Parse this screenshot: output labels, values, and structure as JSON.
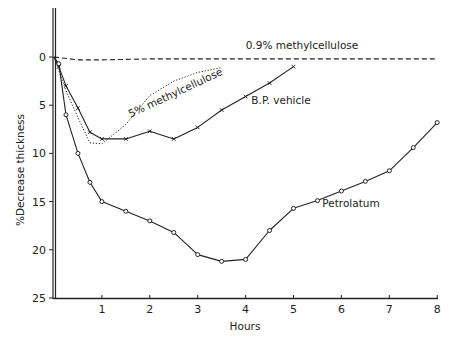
{
  "chart_data": {
    "type": "line",
    "title": "",
    "xlabel": "Hours",
    "ylabel": "%Decrease thickness",
    "xlim": [
      0,
      8
    ],
    "ylim": [
      0,
      25
    ],
    "y_inverted": true,
    "grid": false,
    "legend": "none (inline annotations)",
    "x_ticks": [
      "1",
      "2",
      "3",
      "4",
      "5",
      "6",
      "7",
      "8"
    ],
    "y_ticks": [
      "0",
      "5",
      "10",
      "15",
      "20",
      "25"
    ],
    "series": [
      {
        "name": "0.9% methylcellulose",
        "style": "dashed",
        "marker": "none",
        "x": [
          0,
          0.5,
          1,
          2,
          3,
          4,
          5,
          6,
          7,
          8
        ],
        "y": [
          0,
          0.3,
          0.3,
          0.2,
          0.2,
          0.2,
          0.2,
          0.2,
          0.2,
          0.2
        ]
      },
      {
        "name": "5% methylcellulose",
        "style": "dotted",
        "marker": "none",
        "x": [
          0,
          0.25,
          0.5,
          0.75,
          1,
          1.5,
          2,
          2.5,
          3,
          3.5
        ],
        "y": [
          0,
          3.5,
          6.3,
          8.9,
          9.0,
          7.0,
          4.0,
          2.5,
          1.6,
          1.1
        ]
      },
      {
        "name": "B.P. vehicle",
        "style": "solid",
        "marker": "x",
        "x": [
          0,
          0.1,
          0.25,
          0.5,
          0.75,
          1,
          1.5,
          2,
          2.5,
          3,
          3.5,
          4,
          4.5,
          5
        ],
        "y": [
          0,
          1.0,
          3.0,
          5.3,
          7.8,
          8.5,
          8.5,
          7.7,
          8.5,
          7.3,
          5.5,
          4.1,
          2.7,
          1.0
        ]
      },
      {
        "name": "Petrolatum",
        "style": "solid",
        "marker": "o",
        "x": [
          0,
          0.1,
          0.25,
          0.5,
          0.75,
          1,
          1.5,
          2,
          2.5,
          3,
          3.5,
          4,
          4.5,
          5,
          5.5,
          6,
          6.5,
          7,
          7.5,
          8
        ],
        "y": [
          0,
          0.7,
          6.0,
          10.0,
          13.0,
          15.0,
          16.0,
          17.0,
          18.2,
          20.5,
          21.2,
          21.0,
          18.0,
          15.7,
          14.9,
          13.9,
          12.9,
          11.8,
          9.4,
          6.8
        ]
      }
    ],
    "annotations": [
      {
        "text": "0.9% methylcellulose",
        "near_series": "0.9% methylcellulose"
      },
      {
        "text": "5% methylcellulose",
        "near_series": "5% methylcellulose",
        "rotated": true
      },
      {
        "text": "B.P. vehicle",
        "near_series": "B.P. vehicle"
      },
      {
        "text": "Petrolatum",
        "near_series": "Petrolatum"
      }
    ]
  },
  "labels": {
    "xlabel": "Hours",
    "ylabel": "%Decrease thickness",
    "ann_09": "0.9% methylcellulose",
    "ann_5": "5% methylcellulose",
    "ann_bp": "B.P. vehicle",
    "ann_pet": "Petrolatum",
    "x_ticks": [
      "1",
      "2",
      "3",
      "4",
      "5",
      "6",
      "7",
      "8"
    ],
    "y_ticks": [
      "0",
      "5",
      "10",
      "15",
      "20",
      "25"
    ]
  }
}
